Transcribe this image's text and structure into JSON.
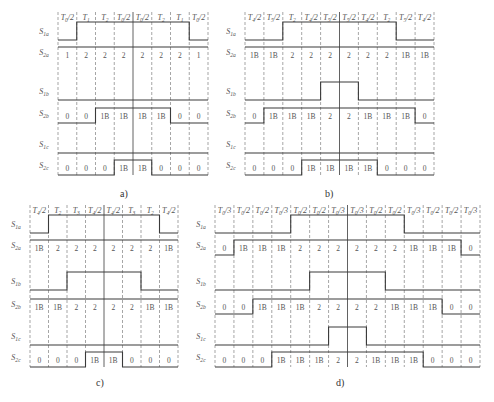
{
  "colors": {
    "line": "#3a3a3a",
    "dash": "#6a6a6a",
    "text": "#555555"
  },
  "panels": [
    {
      "id": "a",
      "caption": "a)",
      "x0": 58,
      "x1": 208,
      "header_y": 20,
      "caption_pos": [
        120,
        197
      ],
      "headers": [
        "T0/2",
        "T1",
        "T2",
        "T0/2",
        "T0/2",
        "T2",
        "T1",
        "T0/2"
      ],
      "rows": [
        {
          "label": "S1a",
          "type": "wave",
          "y": 40,
          "levels": [
            0,
            1,
            1,
            1,
            1,
            1,
            1,
            0
          ]
        },
        {
          "label": "S2a",
          "type": "cells",
          "y": 58,
          "values": [
            "1",
            "2",
            "2",
            "2",
            "2",
            "2",
            "2",
            "1"
          ],
          "levels": [
            1,
            1,
            1,
            1,
            1,
            1,
            1,
            1
          ]
        },
        {
          "label": "S1b",
          "type": "wave",
          "y": 100,
          "levels": [
            0,
            0,
            0,
            0,
            0,
            0,
            0,
            0
          ]
        },
        {
          "label": "S2b",
          "type": "cells",
          "y": 119,
          "values": [
            "0",
            "0",
            "1B",
            "1B",
            "1B",
            "1B",
            "0",
            "0"
          ],
          "levels": [
            0,
            0,
            1,
            1,
            1,
            1,
            0,
            0
          ]
        },
        {
          "label": "S1c",
          "type": "wave",
          "y": 153,
          "levels": [
            0,
            0,
            0,
            0,
            0,
            0,
            0,
            0
          ]
        },
        {
          "label": "S2c",
          "type": "cells",
          "y": 171,
          "values": [
            "0",
            "0",
            "0",
            "1B",
            "1B",
            "0",
            "0",
            "0"
          ],
          "levels": [
            0,
            0,
            0,
            1,
            1,
            0,
            0,
            0
          ]
        }
      ]
    },
    {
      "id": "b",
      "caption": "b)",
      "x0": 245,
      "x1": 434,
      "header_y": 20,
      "caption_pos": [
        325,
        197
      ],
      "headers": [
        "T4/2",
        "T5/2",
        "T2",
        "T4/2",
        "T5/2",
        "T5/2",
        "T4/2",
        "T2",
        "T5/2",
        "T4/2"
      ],
      "rows": [
        {
          "label": "S1a",
          "type": "wave",
          "y": 40,
          "levels": [
            0,
            0,
            1,
            1,
            1,
            1,
            1,
            1,
            0,
            0
          ]
        },
        {
          "label": "S2a",
          "type": "cells",
          "y": 58,
          "values": [
            "1B",
            "1B",
            "2",
            "2",
            "2",
            "2",
            "2",
            "2",
            "1B",
            "1B"
          ],
          "levels": [
            1,
            1,
            1,
            1,
            1,
            1,
            1,
            1,
            1,
            1
          ]
        },
        {
          "label": "S1b",
          "type": "wave",
          "y": 100,
          "levels": [
            0,
            0,
            0,
            0,
            1,
            1,
            0,
            0,
            0,
            0
          ]
        },
        {
          "label": "S2b",
          "type": "cells",
          "y": 119,
          "values": [
            "0",
            "1B",
            "1B",
            "1B",
            "2",
            "2",
            "1B",
            "1B",
            "1B",
            "0"
          ],
          "levels": [
            0,
            1,
            1,
            1,
            1,
            1,
            1,
            1,
            1,
            0
          ]
        },
        {
          "label": "S1c",
          "type": "wave",
          "y": 153,
          "levels": [
            0,
            0,
            0,
            0,
            0,
            0,
            0,
            0,
            0,
            0
          ]
        },
        {
          "label": "S2c",
          "type": "cells",
          "y": 171,
          "values": [
            "0",
            "0",
            "0",
            "1B",
            "1B",
            "1B",
            "1B",
            "0",
            "0",
            "0"
          ],
          "levels": [
            0,
            0,
            0,
            1,
            1,
            1,
            1,
            0,
            0,
            0
          ]
        }
      ]
    },
    {
      "id": "c",
      "caption": "c)",
      "x0": 30,
      "x1": 178,
      "header_y": 213,
      "caption_pos": [
        96,
        386
      ],
      "headers": [
        "T4/2",
        "T2",
        "T3",
        "T4/2",
        "T4/2",
        "T3",
        "T2",
        "T4/2"
      ],
      "rows": [
        {
          "label": "S1a",
          "type": "wave",
          "y": 233,
          "levels": [
            0,
            1,
            1,
            1,
            1,
            1,
            1,
            0
          ]
        },
        {
          "label": "S2a",
          "type": "cells",
          "y": 251,
          "values": [
            "1B",
            "2",
            "2",
            "2",
            "2",
            "2",
            "2",
            "1B"
          ],
          "levels": [
            1,
            1,
            1,
            1,
            1,
            1,
            1,
            1
          ]
        },
        {
          "label": "S1b",
          "type": "wave",
          "y": 290,
          "levels": [
            0,
            0,
            1,
            1,
            1,
            1,
            0,
            0
          ]
        },
        {
          "label": "S2b",
          "type": "cells",
          "y": 310,
          "values": [
            "1B",
            "1B",
            "2",
            "2",
            "2",
            "2",
            "1B",
            "1B"
          ],
          "levels": [
            1,
            1,
            1,
            1,
            1,
            1,
            1,
            1
          ]
        },
        {
          "label": "S1c",
          "type": "wave",
          "y": 345,
          "levels": [
            0,
            0,
            0,
            0,
            0,
            0,
            0,
            0
          ]
        },
        {
          "label": "S2c",
          "type": "cells",
          "y": 363,
          "values": [
            "0",
            "0",
            "0",
            "1B",
            "1B",
            "0",
            "0",
            "0"
          ],
          "levels": [
            0,
            0,
            0,
            1,
            1,
            0,
            0,
            0
          ]
        }
      ]
    },
    {
      "id": "d",
      "caption": "d)",
      "x0": 215,
      "x1": 480,
      "header_y": 213,
      "caption_pos": [
        336,
        386
      ],
      "headers": [
        "T0/3",
        "T0/2",
        "T0/2",
        "T0/3",
        "T0/2",
        "T0/2",
        "T0/3",
        "T0/3",
        "T0/2",
        "T0/2",
        "T0/3",
        "T0/2",
        "T0/2",
        "T0/3"
      ],
      "rows": [
        {
          "label": "S1a",
          "type": "wave",
          "y": 233,
          "levels": [
            0,
            0,
            0,
            0,
            1,
            1,
            1,
            1,
            1,
            1,
            0,
            0,
            0,
            0
          ]
        },
        {
          "label": "S2a",
          "type": "cells",
          "y": 251,
          "values": [
            "0",
            "1B",
            "1B",
            "1B",
            "2",
            "2",
            "2",
            "2",
            "2",
            "2",
            "1B",
            "1B",
            "1B",
            "0"
          ],
          "levels": [
            0,
            1,
            1,
            1,
            1,
            1,
            1,
            1,
            1,
            1,
            1,
            1,
            1,
            0
          ]
        },
        {
          "label": "S1b",
          "type": "wave",
          "y": 290,
          "levels": [
            0,
            0,
            0,
            0,
            0,
            1,
            1,
            1,
            1,
            0,
            0,
            0,
            0,
            0
          ]
        },
        {
          "label": "S2b",
          "type": "cells",
          "y": 310,
          "values": [
            "0",
            "0",
            "1B",
            "1B",
            "1B",
            "2",
            "2",
            "2",
            "2",
            "1B",
            "1B",
            "1B",
            "0",
            "0"
          ],
          "levels": [
            0,
            0,
            1,
            1,
            1,
            1,
            1,
            1,
            1,
            1,
            1,
            1,
            0,
            0
          ]
        },
        {
          "label": "S1c",
          "type": "wave",
          "y": 345,
          "levels": [
            0,
            0,
            0,
            0,
            0,
            0,
            1,
            1,
            0,
            0,
            0,
            0,
            0,
            0
          ]
        },
        {
          "label": "S2c",
          "type": "cells",
          "y": 363,
          "values": [
            "0",
            "0",
            "0",
            "1B",
            "1B",
            "1B",
            "2",
            "2",
            "1B",
            "1B",
            "1B",
            "0",
            "0",
            "0"
          ],
          "levels": [
            0,
            0,
            0,
            1,
            1,
            1,
            1,
            1,
            1,
            1,
            1,
            0,
            0,
            0
          ]
        }
      ]
    }
  ]
}
